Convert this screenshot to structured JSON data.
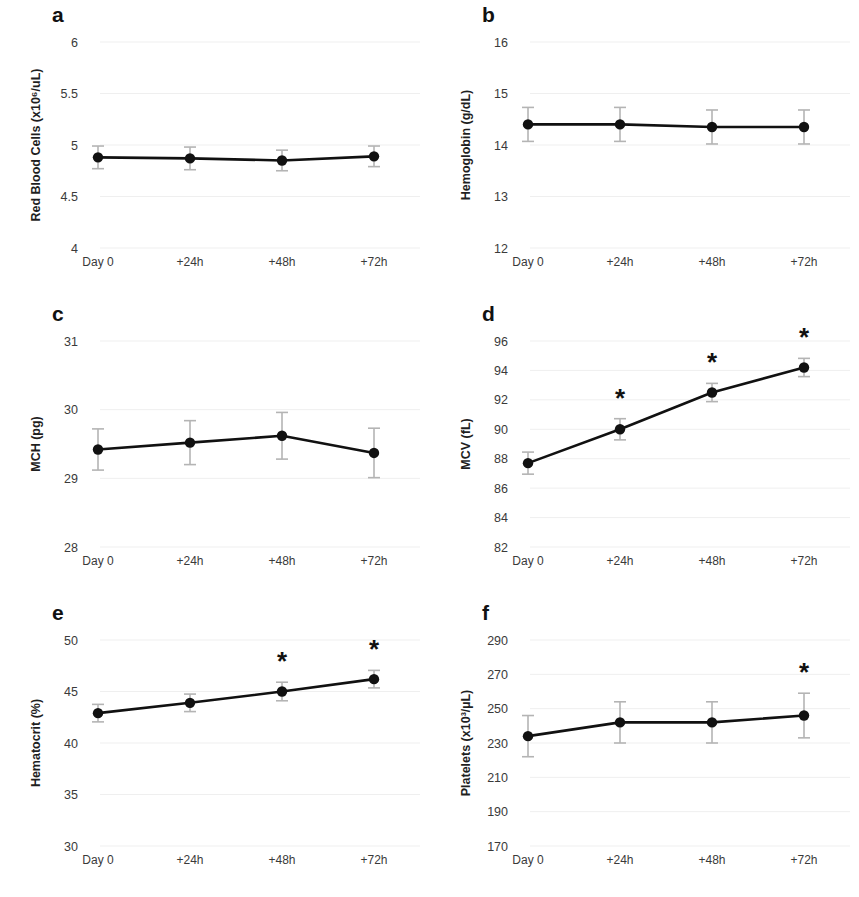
{
  "figure": {
    "background_color": "#ffffff",
    "line_color": "#111111",
    "error_bar_color": "#b4b4b4",
    "panel_count": 6
  },
  "panels": [
    {
      "letter": "a",
      "ylabel": "Red Blood Cells (x10⁶/uL)",
      "yticks": [
        "6",
        "5.5",
        "5",
        "4.5",
        "4"
      ],
      "xticks": [
        "Day 0",
        "+24h",
        "+48h",
        "+72h"
      ]
    },
    {
      "letter": "b",
      "ylabel": "Hemoglobin (g/dL)",
      "yticks": [
        "16",
        "15",
        "14",
        "13",
        "12"
      ],
      "xticks": [
        "Day 0",
        "+24h",
        "+48h",
        "+72h"
      ]
    },
    {
      "letter": "c",
      "ylabel": "MCH (pg)",
      "yticks": [
        "31",
        "30",
        "29",
        "28"
      ],
      "xticks": [
        "Day 0",
        "+24h",
        "+48h",
        "+72h"
      ]
    },
    {
      "letter": "d",
      "ylabel": "MCV (fL)",
      "yticks": [
        "96",
        "94",
        "92",
        "90",
        "88",
        "86",
        "84",
        "82"
      ],
      "xticks": [
        "Day 0",
        "+24h",
        "+48h",
        "+72h"
      ]
    },
    {
      "letter": "e",
      "ylabel": "Hematocrit (%)",
      "yticks": [
        "50",
        "45",
        "40",
        "35",
        "30"
      ],
      "xticks": [
        "Day 0",
        "+24h",
        "+48h",
        "+72h"
      ]
    },
    {
      "letter": "f",
      "ylabel": "Platelets  (x10³/µL)",
      "yticks": [
        "290",
        "270",
        "250",
        "230",
        "210",
        "190",
        "170"
      ],
      "xticks": [
        "Day 0",
        "+24h",
        "+48h",
        "+72h"
      ]
    }
  ],
  "chart_data": [
    {
      "type": "line",
      "panel": "a",
      "title": "",
      "xlabel": "",
      "ylabel": "Red Blood Cells (x10⁶/uL)",
      "categories": [
        "Day 0",
        "+24h",
        "+48h",
        "+72h"
      ],
      "values": [
        4.88,
        4.87,
        4.85,
        4.89
      ],
      "errors": [
        0.11,
        0.11,
        0.1,
        0.1
      ],
      "significance_markers": [],
      "ylim": [
        4,
        6
      ],
      "ytick_values": [
        6,
        5.5,
        5,
        4.5,
        4
      ],
      "grid": false,
      "legend": "none"
    },
    {
      "type": "line",
      "panel": "b",
      "title": "",
      "xlabel": "",
      "ylabel": "Hemoglobin (g/dL)",
      "categories": [
        "Day 0",
        "+24h",
        "+48h",
        "+72h"
      ],
      "values": [
        14.4,
        14.4,
        14.35,
        14.35
      ],
      "errors": [
        0.33,
        0.33,
        0.33,
        0.33
      ],
      "significance_markers": [],
      "ylim": [
        12,
        16
      ],
      "ytick_values": [
        16,
        15,
        14,
        13,
        12
      ],
      "grid": false,
      "legend": "none"
    },
    {
      "type": "line",
      "panel": "c",
      "title": "",
      "xlabel": "",
      "ylabel": "MCH (pg)",
      "categories": [
        "Day 0",
        "+24h",
        "+48h",
        "+72h"
      ],
      "values": [
        29.42,
        29.52,
        29.62,
        29.37
      ],
      "errors": [
        0.3,
        0.32,
        0.34,
        0.36
      ],
      "significance_markers": [],
      "ylim": [
        28,
        31
      ],
      "ytick_values": [
        31,
        30,
        29,
        28
      ],
      "grid": false,
      "legend": "none"
    },
    {
      "type": "line",
      "panel": "d",
      "title": "",
      "xlabel": "",
      "ylabel": "MCV (fL)",
      "categories": [
        "Day 0",
        "+24h",
        "+48h",
        "+72h"
      ],
      "values": [
        87.7,
        90.0,
        92.5,
        94.2
      ],
      "errors": [
        0.75,
        0.72,
        0.62,
        0.62
      ],
      "significance_markers": [
        "",
        "*",
        "*",
        "*"
      ],
      "ylim": [
        82,
        96
      ],
      "ytick_values": [
        96,
        94,
        92,
        90,
        88,
        86,
        84,
        82
      ],
      "grid": false,
      "legend": "none"
    },
    {
      "type": "line",
      "panel": "e",
      "title": "",
      "xlabel": "",
      "ylabel": "Hematocrit (%)",
      "categories": [
        "Day 0",
        "+24h",
        "+48h",
        "+72h"
      ],
      "values": [
        42.9,
        43.9,
        45.0,
        46.2
      ],
      "errors": [
        0.85,
        0.85,
        0.9,
        0.85
      ],
      "significance_markers": [
        "",
        "",
        "*",
        "*"
      ],
      "ylim": [
        30,
        50
      ],
      "ytick_values": [
        50,
        45,
        40,
        35,
        30
      ],
      "grid": false,
      "legend": "none"
    },
    {
      "type": "line",
      "panel": "f",
      "title": "",
      "xlabel": "",
      "ylabel": "Platelets  (x10³/µL)",
      "categories": [
        "Day 0",
        "+24h",
        "+48h",
        "+72h"
      ],
      "values": [
        234,
        242,
        242,
        246
      ],
      "errors": [
        12,
        12,
        12,
        13
      ],
      "significance_markers": [
        "",
        "",
        "",
        "*"
      ],
      "ylim": [
        170,
        290
      ],
      "ytick_values": [
        290,
        270,
        250,
        230,
        210,
        190,
        170
      ],
      "grid": false,
      "legend": "none"
    }
  ]
}
